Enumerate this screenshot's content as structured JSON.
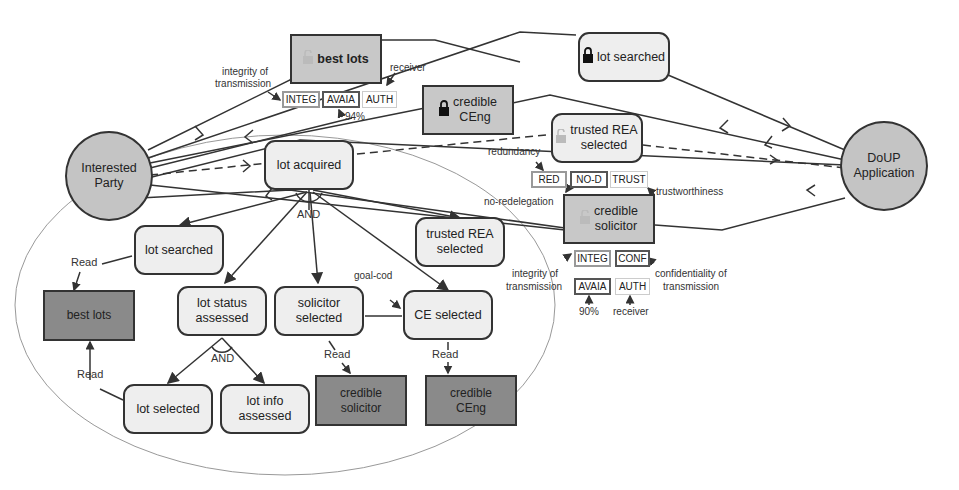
{
  "actors": {
    "interested_party": {
      "label_line1": "Interested",
      "label_line2": "Party"
    },
    "doup_application": {
      "label_line1": "DoUP",
      "label_line2": "Application"
    }
  },
  "top_resources": {
    "best_lots": {
      "label": "best lots",
      "lock": "unlocked-lock-icon"
    },
    "lot_searched": {
      "label": "lot searched",
      "lock": "locked-lock-icon"
    },
    "credible_ceng": {
      "label_line1": "credible",
      "label_line2": "CEng",
      "lock": "locked-lock-icon"
    },
    "trusted_rea": {
      "label_line1": "trusted REA",
      "label_line2": "selected",
      "lock": "unlocked-lock-icon"
    },
    "credible_solicitor": {
      "label_line1": "credible",
      "label_line2": "solicitor",
      "lock": "unlocked-lock-icon"
    }
  },
  "tags": {
    "best_lots": [
      "INTEG",
      "AVAIA",
      "AUTH"
    ],
    "trusted_rea": [
      "RED",
      "NO-D",
      "TRUST"
    ],
    "solicitor_row1": [
      "INTEG",
      "CONF"
    ],
    "solicitor_row2": [
      "AVAIA",
      "AUTH"
    ]
  },
  "annotations": {
    "integrity_top_1": "integrity of",
    "integrity_top_2": "transmission",
    "receiver_top": "receiver",
    "pct_top": "94%",
    "redundancy": "redundancy",
    "no_redelegation": "no-redelegation",
    "trustworthiness": "trustworthiness",
    "integrity_sol_1": "integrity of",
    "integrity_sol_2": "transmission",
    "conf_1": "confidentiality of",
    "conf_2": "transmission",
    "pct_sol": "90%",
    "receiver_sol": "receiver",
    "goal_cod": "goal-cod",
    "and_top": "AND",
    "and_bottom": "AND",
    "equal_symbol": "=",
    "read_labels": [
      "Read",
      "Read",
      "Read",
      "Read"
    ]
  },
  "goals": {
    "lot_acquired": "lot acquired",
    "lot_searched": "lot searched",
    "trusted_rea_line1": "trusted REA",
    "trusted_rea_line2": "selected",
    "lot_status_line1": "lot status",
    "lot_status_line2": "assessed",
    "solicitor_selected_line1": "solicitor",
    "solicitor_selected_line2": "selected",
    "ce_selected": "CE selected",
    "lot_selected": "lot selected",
    "lot_info_line1": "lot info",
    "lot_info_line2": "assessed"
  },
  "inner_resources": {
    "best_lots": "best lots",
    "credible_solicitor_line1": "credible",
    "credible_solicitor_line2": "solicitor",
    "credible_ceng_line1": "credible",
    "credible_ceng_line2": "CEng"
  }
}
